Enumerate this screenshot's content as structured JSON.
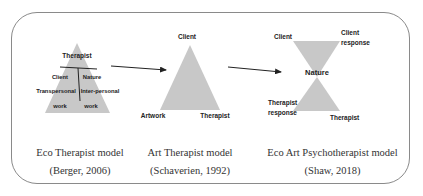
{
  "models": [
    {
      "id": "eco-therapist",
      "title": "Eco Therapist model",
      "citation": "(Berger, 2006)",
      "labels": {
        "top": "Therapist",
        "left_upper": "Client",
        "right_upper": "Nature",
        "left_mid": "Transpersonal",
        "right_mid": "Inter-personal",
        "left_low": "work",
        "right_low": "work"
      }
    },
    {
      "id": "art-therapist",
      "title": "Art Therapist model",
      "citation": "(Schaverien, 1992)",
      "labels": {
        "apex": "Client",
        "bottom_left": "Artwork",
        "bottom_right": "Therapist"
      }
    },
    {
      "id": "eco-art-psychotherapist",
      "title": "Eco Art Psychotherapist model",
      "citation": "(Shaw, 2018)",
      "labels": {
        "top_left": "Client",
        "top_right_1": "Client",
        "top_right_2": "response",
        "center": "Nature",
        "bottom_left_1": "Therapist",
        "bottom_left_2": "response",
        "bottom_right": "Therapist"
      }
    }
  ],
  "colors": {
    "shape_fill": "#c8c8c8",
    "frame_border": "#8a8a8a",
    "text": "#222222",
    "arrow": "#222222"
  }
}
